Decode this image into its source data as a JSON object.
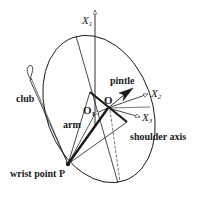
{
  "figure": {
    "type": "diagram"
  },
  "labels": {
    "x1": "X",
    "x1_sub": "1",
    "x2": "X",
    "x2_sub": "2",
    "x3": "X",
    "x3_sub": "3",
    "pintle": "pintle",
    "club": "club",
    "arm": "arm",
    "o_upper": "O",
    "o_lower": "O",
    "o_lower_sub": "1",
    "shoulder_axis": "shoulder axis",
    "wrist_point": "wrist point P"
  },
  "colors": {
    "stroke": "#1a1a1a",
    "background": "#ffffff"
  }
}
